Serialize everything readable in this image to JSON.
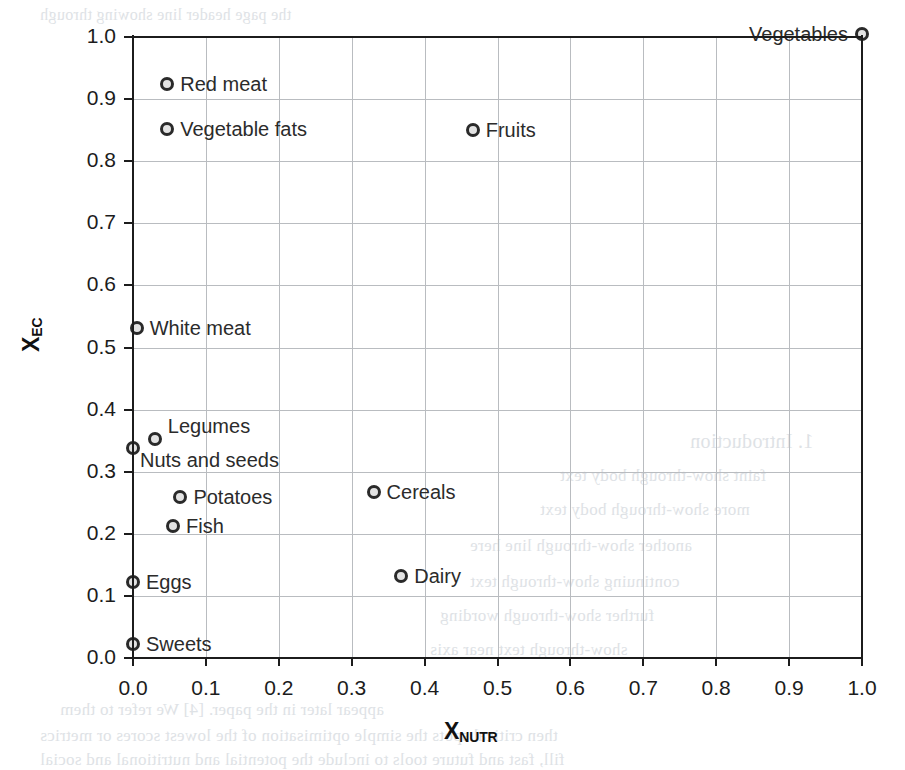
{
  "chart_data": {
    "type": "scatter",
    "title": "",
    "xlabel": "X",
    "xlabel_sub": "NUTR",
    "ylabel": "X",
    "ylabel_sub": "EC",
    "xlim": [
      0.0,
      1.0
    ],
    "ylim": [
      0.0,
      1.0
    ],
    "grid": true,
    "legend": "none",
    "xticks": [
      "0.0",
      "0.1",
      "0.2",
      "0.3",
      "0.4",
      "0.5",
      "0.6",
      "0.7",
      "0.8",
      "0.9",
      "1.0"
    ],
    "yticks": [
      "0.0",
      "0.1",
      "0.2",
      "0.3",
      "0.4",
      "0.5",
      "0.6",
      "0.7",
      "0.8",
      "0.9",
      "1.0"
    ],
    "xtick_values": [
      0.0,
      0.1,
      0.2,
      0.3,
      0.4,
      0.5,
      0.6,
      0.7,
      0.8,
      0.9,
      1.0
    ],
    "ytick_values": [
      0.0,
      0.1,
      0.2,
      0.3,
      0.4,
      0.5,
      0.6,
      0.7,
      0.8,
      0.9,
      1.0
    ],
    "marker_style": "open-circle",
    "marker_edge_color": "#2a2a2a",
    "marker_face_color": "#e3e3e3",
    "grid_color": "#b9bcc0",
    "axis_color": "#1c1c1c",
    "points": [
      {
        "label": "Red meat",
        "x": 0.047,
        "y": 0.925,
        "label_pos": "right"
      },
      {
        "label": "Vegetable fats",
        "x": 0.047,
        "y": 0.852,
        "label_pos": "right"
      },
      {
        "label": "Fruits",
        "x": 0.466,
        "y": 0.85,
        "label_pos": "right"
      },
      {
        "label": "Vegetables",
        "x": 1.0,
        "y": 1.005,
        "label_pos": "left"
      },
      {
        "label": "White meat",
        "x": 0.005,
        "y": 0.532,
        "label_pos": "right"
      },
      {
        "label": "Legumes",
        "x": 0.03,
        "y": 0.352,
        "label_pos": "above-right"
      },
      {
        "label": "Nuts and seeds",
        "x": 0.0,
        "y": 0.338,
        "label_pos": "below-right"
      },
      {
        "label": "Cereals",
        "x": 0.33,
        "y": 0.268,
        "label_pos": "right"
      },
      {
        "label": "Potatoes",
        "x": 0.065,
        "y": 0.26,
        "label_pos": "right"
      },
      {
        "label": "Fish",
        "x": 0.055,
        "y": 0.212,
        "label_pos": "right"
      },
      {
        "label": "Dairy",
        "x": 0.368,
        "y": 0.132,
        "label_pos": "right"
      },
      {
        "label": "Eggs",
        "x": 0.0,
        "y": 0.123,
        "label_pos": "right"
      },
      {
        "label": "Sweets",
        "x": 0.0,
        "y": 0.022,
        "label_pos": "right"
      }
    ]
  },
  "background_bleed": {
    "note": "faint mirrored show-through text from the reverse of the scanned page",
    "lines": [
      {
        "text": "the page header line showing through",
        "x": 40,
        "y": 6,
        "size": 16
      },
      {
        "text": "1. Introduction",
        "x": 690,
        "y": 430,
        "size": 20
      },
      {
        "text": "faint show-through body text",
        "x": 560,
        "y": 466,
        "size": 17
      },
      {
        "text": "more show-through body text",
        "x": 540,
        "y": 500,
        "size": 17
      },
      {
        "text": "another show-through line here",
        "x": 470,
        "y": 536,
        "size": 17
      },
      {
        "text": "continuing show-through text",
        "x": 470,
        "y": 572,
        "size": 17
      },
      {
        "text": "further show-through wording",
        "x": 440,
        "y": 606,
        "size": 17
      },
      {
        "text": "show-through text near axis",
        "x": 430,
        "y": 640,
        "size": 17
      },
      {
        "text": "appear later in the paper. [4] We refer to them",
        "x": 60,
        "y": 700,
        "size": 17
      },
      {
        "text": "then critical spots the simple optimisation of the lowest scores or metrics",
        "x": 40,
        "y": 726,
        "size": 17
      },
      {
        "text": "fill, fast and future tools to include the potential and nutritional and social",
        "x": 40,
        "y": 750,
        "size": 17
      }
    ]
  }
}
